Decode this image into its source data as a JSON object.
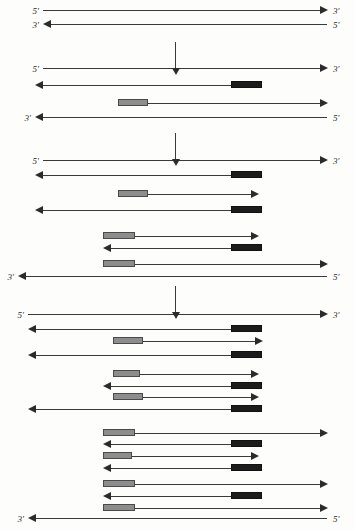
{
  "diagram": {
    "labels": {
      "five_prime": "5'",
      "three_prime": "3'"
    },
    "colors": {
      "line": "#3a3a3a",
      "arrowhead": "#2b2b2b",
      "primer_forward": "#8d8d8d",
      "primer_reverse": "#1c1c1c",
      "background": "#fdfdfc"
    },
    "step_arrows": [
      {
        "name": "step-arrow-1",
        "x": 175,
        "y": 42,
        "length": 26
      },
      {
        "name": "step-arrow-2",
        "x": 175,
        "y": 133,
        "length": 26
      },
      {
        "name": "step-arrow-3",
        "x": 175,
        "y": 286,
        "length": 26
      }
    ],
    "groups": [
      {
        "name": "cycle-0-template",
        "strands": [
          {
            "name": "strand-template-top",
            "y": 10,
            "x1": 43,
            "x2": 327,
            "dir": "right",
            "left_label": "5'",
            "right_label": "3'",
            "blocks": []
          },
          {
            "name": "strand-template-bottom",
            "y": 24,
            "x1": 43,
            "x2": 327,
            "dir": "left",
            "left_label": "3'",
            "right_label": "5'",
            "blocks": []
          }
        ]
      },
      {
        "name": "cycle-1-products",
        "strands": [
          {
            "name": "strand-1-top",
            "y": 68,
            "x1": 43,
            "x2": 327,
            "dir": "right",
            "left_label": "5'",
            "right_label": "3'",
            "blocks": []
          },
          {
            "name": "strand-1-new-reverse",
            "y": 85,
            "x1": 35,
            "x2": 262,
            "dir": "left",
            "left_label": "",
            "right_label": "",
            "blocks": [
              {
                "type": "dark",
                "x1": 231,
                "x2": 262
              }
            ]
          },
          {
            "name": "strand-1-new-forward",
            "y": 103,
            "x1": 118,
            "x2": 327,
            "dir": "right",
            "left_label": "",
            "right_label": "",
            "blocks": [
              {
                "type": "gray",
                "x1": 118,
                "x2": 148
              }
            ]
          },
          {
            "name": "strand-1-bottom",
            "y": 117,
            "x1": 35,
            "x2": 327,
            "dir": "left",
            "left_label": "3'",
            "right_label": "5'",
            "blocks": []
          }
        ]
      },
      {
        "name": "cycle-2-products",
        "strands": [
          {
            "name": "strand-2-top",
            "y": 160,
            "x1": 43,
            "x2": 327,
            "dir": "right",
            "left_label": "5'",
            "right_label": "3'",
            "blocks": []
          },
          {
            "name": "strand-2-reverse-a",
            "y": 175,
            "x1": 35,
            "x2": 262,
            "dir": "left",
            "left_label": "",
            "right_label": "",
            "blocks": [
              {
                "type": "dark",
                "x1": 231,
                "x2": 262
              }
            ]
          },
          {
            "name": "strand-2-forward-a",
            "y": 194,
            "x1": 118,
            "x2": 258,
            "dir": "right",
            "left_label": "",
            "right_label": "",
            "blocks": [
              {
                "type": "gray",
                "x1": 118,
                "x2": 148
              }
            ]
          },
          {
            "name": "strand-2-reverse-b",
            "y": 210,
            "x1": 35,
            "x2": 262,
            "dir": "left",
            "left_label": "",
            "right_label": "",
            "blocks": [
              {
                "type": "dark",
                "x1": 231,
                "x2": 262
              }
            ]
          },
          {
            "name": "strand-2-forward-b",
            "y": 236,
            "x1": 103,
            "x2": 258,
            "dir": "right",
            "left_label": "",
            "right_label": "",
            "blocks": [
              {
                "type": "gray",
                "x1": 103,
                "x2": 135
              }
            ]
          },
          {
            "name": "strand-2-reverse-c",
            "y": 248,
            "x1": 103,
            "x2": 262,
            "dir": "left",
            "left_label": "",
            "right_label": "",
            "blocks": [
              {
                "type": "dark",
                "x1": 231,
                "x2": 262
              }
            ]
          },
          {
            "name": "strand-2-forward-c",
            "y": 264,
            "x1": 103,
            "x2": 327,
            "dir": "right",
            "left_label": "",
            "right_label": "",
            "blocks": [
              {
                "type": "gray",
                "x1": 103,
                "x2": 135
              }
            ]
          },
          {
            "name": "strand-2-bottom",
            "y": 276,
            "x1": 18,
            "x2": 327,
            "dir": "left",
            "left_label": "3'",
            "right_label": "5'",
            "blocks": []
          }
        ]
      },
      {
        "name": "cycle-3-products",
        "strands": [
          {
            "name": "strand-3-top",
            "y": 314,
            "x1": 28,
            "x2": 327,
            "dir": "right",
            "left_label": "5'",
            "right_label": "3'",
            "blocks": []
          },
          {
            "name": "strand-3-reverse-a",
            "y": 329,
            "x1": 28,
            "x2": 262,
            "dir": "left",
            "left_label": "",
            "right_label": "",
            "blocks": [
              {
                "type": "dark",
                "x1": 231,
                "x2": 262
              }
            ]
          },
          {
            "name": "strand-3-forward-a",
            "y": 341,
            "x1": 113,
            "x2": 262,
            "dir": "right",
            "left_label": "",
            "right_label": "",
            "blocks": [
              {
                "type": "gray",
                "x1": 113,
                "x2": 143
              }
            ]
          },
          {
            "name": "strand-3-reverse-b",
            "y": 355,
            "x1": 28,
            "x2": 262,
            "dir": "left",
            "left_label": "",
            "right_label": "",
            "blocks": [
              {
                "type": "dark",
                "x1": 231,
                "x2": 262
              }
            ]
          },
          {
            "name": "strand-3-forward-b",
            "y": 374,
            "x1": 113,
            "x2": 258,
            "dir": "right",
            "left_label": "",
            "right_label": "",
            "blocks": [
              {
                "type": "gray",
                "x1": 113,
                "x2": 140
              }
            ]
          },
          {
            "name": "strand-3-reverse-c",
            "y": 386,
            "x1": 103,
            "x2": 262,
            "dir": "left",
            "left_label": "",
            "right_label": "",
            "blocks": [
              {
                "type": "dark",
                "x1": 231,
                "x2": 262
              }
            ]
          },
          {
            "name": "strand-3-forward-c",
            "y": 397,
            "x1": 113,
            "x2": 258,
            "dir": "right",
            "left_label": "",
            "right_label": "",
            "blocks": [
              {
                "type": "gray",
                "x1": 113,
                "x2": 143
              }
            ]
          },
          {
            "name": "strand-3-reverse-d",
            "y": 409,
            "x1": 28,
            "x2": 262,
            "dir": "left",
            "left_label": "",
            "right_label": "",
            "blocks": [
              {
                "type": "dark",
                "x1": 231,
                "x2": 262
              }
            ]
          },
          {
            "name": "strand-3-forward-d",
            "y": 433,
            "x1": 103,
            "x2": 327,
            "dir": "right",
            "left_label": "",
            "right_label": "",
            "blocks": [
              {
                "type": "gray",
                "x1": 103,
                "x2": 135
              }
            ]
          },
          {
            "name": "strand-3-reverse-e",
            "y": 444,
            "x1": 103,
            "x2": 262,
            "dir": "left",
            "left_label": "",
            "right_label": "",
            "blocks": [
              {
                "type": "dark",
                "x1": 231,
                "x2": 262
              }
            ]
          },
          {
            "name": "strand-3-forward-e",
            "y": 456,
            "x1": 103,
            "x2": 258,
            "dir": "right",
            "left_label": "",
            "right_label": "",
            "blocks": [
              {
                "type": "gray",
                "x1": 103,
                "x2": 132
              }
            ]
          },
          {
            "name": "strand-3-reverse-f",
            "y": 468,
            "x1": 103,
            "x2": 262,
            "dir": "left",
            "left_label": "",
            "right_label": "",
            "blocks": [
              {
                "type": "dark",
                "x1": 231,
                "x2": 262
              }
            ]
          },
          {
            "name": "strand-3-forward-f",
            "y": 484,
            "x1": 103,
            "x2": 327,
            "dir": "right",
            "left_label": "",
            "right_label": "",
            "blocks": [
              {
                "type": "gray",
                "x1": 103,
                "x2": 135
              }
            ]
          },
          {
            "name": "strand-3-reverse-g",
            "y": 496,
            "x1": 103,
            "x2": 262,
            "dir": "left",
            "left_label": "",
            "right_label": "",
            "blocks": [
              {
                "type": "dark",
                "x1": 231,
                "x2": 262
              }
            ]
          },
          {
            "name": "strand-3-forward-g",
            "y": 508,
            "x1": 103,
            "x2": 327,
            "dir": "right",
            "left_label": "",
            "right_label": "",
            "blocks": [
              {
                "type": "gray",
                "x1": 103,
                "x2": 135
              }
            ]
          },
          {
            "name": "strand-3-bottom",
            "y": 518,
            "x1": 28,
            "x2": 327,
            "dir": "left",
            "left_label": "3'",
            "right_label": "5'",
            "blocks": []
          }
        ]
      }
    ]
  }
}
